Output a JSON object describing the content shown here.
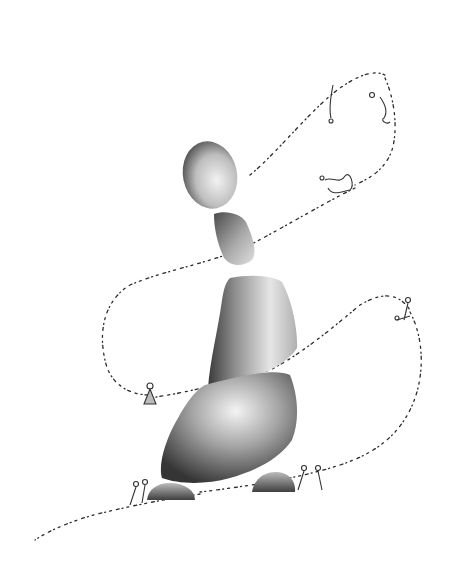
{
  "artwork": {
    "description": "Ink-wash illustration of stacked stones with a winding path of tiny script marks and small figures",
    "palette": {
      "background": "#ffffff",
      "stone_dark": "#3a3a3a",
      "stone_mid": "#8a8a8a",
      "stone_light": "#d8d8d8",
      "ink": "#2b2b2b"
    },
    "stones": [
      {
        "name": "top-oval-stone",
        "cx": 210,
        "cy": 173,
        "rx": 27,
        "ry": 35
      },
      {
        "name": "small-stone",
        "x": 213,
        "y": 212
      },
      {
        "name": "middle-stone",
        "x": 207,
        "y": 276
      },
      {
        "name": "large-base-stone",
        "x": 160,
        "y": 368
      },
      {
        "name": "left-pebble",
        "x": 145,
        "y": 483
      },
      {
        "name": "right-pebble",
        "x": 253,
        "y": 470
      }
    ],
    "figures": [
      {
        "name": "figure-top-right",
        "x": 380,
        "y": 95
      },
      {
        "name": "figures-cluster",
        "x": 330,
        "y": 180
      },
      {
        "name": "figure-left",
        "x": 146,
        "y": 390
      },
      {
        "name": "figures-bottom-left",
        "x": 133,
        "y": 482
      },
      {
        "name": "figures-bottom-right",
        "x": 305,
        "y": 470
      },
      {
        "name": "figure-right-loop",
        "x": 400,
        "y": 310
      }
    ]
  }
}
